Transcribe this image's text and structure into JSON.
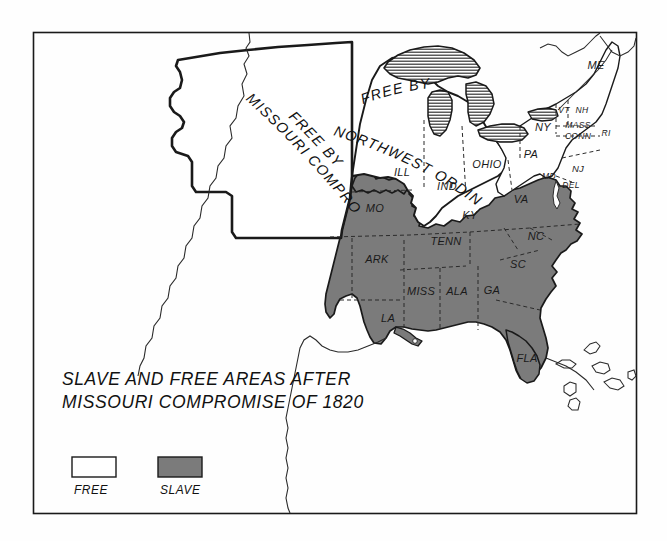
{
  "figure": {
    "kind": "historical-map",
    "title_line1": "SLAVE AND FREE AREAS AFTER",
    "title_line2": "MISSOURI COMPROMISE OF 1820",
    "frame_color": "#1a1a1a",
    "background_color": "#fefefe"
  },
  "colors": {
    "slave_fill": "#7b7b7b",
    "free_fill": "#ffffff",
    "outline": "#1a1a1a",
    "lake_hatch": "#2a2a2a",
    "internal_border": "#2b2b2b"
  },
  "regions": [
    {
      "id": "free-missouri-compromise",
      "label_line1": "FREE BY",
      "label_line2": "MISSOURI COMPROMISE",
      "status": "FREE"
    },
    {
      "id": "free-northwest-ordinance",
      "label_line1": "FREE BY",
      "label_line2": "NORTHWEST ORDINANCE",
      "status": "FREE"
    }
  ],
  "states": {
    "free": [
      {
        "abbr": "ILL",
        "x": 402,
        "y": 176,
        "size": ""
      },
      {
        "abbr": "IND",
        "x": 447,
        "y": 190,
        "size": ""
      },
      {
        "abbr": "OHIO",
        "x": 487,
        "y": 168,
        "size": ""
      },
      {
        "abbr": "PA",
        "x": 531,
        "y": 158,
        "size": ""
      },
      {
        "abbr": "NY",
        "x": 543,
        "y": 131,
        "size": ""
      },
      {
        "abbr": "NJ",
        "x": 578,
        "y": 172,
        "size": "sm"
      },
      {
        "abbr": "DEL",
        "x": 571,
        "y": 188,
        "size": "xs"
      },
      {
        "abbr": "ME",
        "x": 596,
        "y": 69,
        "size": ""
      },
      {
        "abbr": "VT",
        "x": 564,
        "y": 113,
        "size": "xs"
      },
      {
        "abbr": "NH",
        "x": 582,
        "y": 113,
        "size": "xs"
      },
      {
        "abbr": "MASS",
        "x": 578,
        "y": 128,
        "size": "xs"
      },
      {
        "abbr": "CONN",
        "x": 578,
        "y": 139,
        "size": "xs"
      },
      {
        "abbr": "RI",
        "x": 606,
        "y": 136,
        "size": "xs"
      }
    ],
    "slave": [
      {
        "abbr": "MO",
        "x": 375,
        "y": 212,
        "size": ""
      },
      {
        "abbr": "ARK",
        "x": 377,
        "y": 263,
        "size": ""
      },
      {
        "abbr": "LA",
        "x": 388,
        "y": 322,
        "size": ""
      },
      {
        "abbr": "MISS",
        "x": 421,
        "y": 295,
        "size": ""
      },
      {
        "abbr": "ALA",
        "x": 457,
        "y": 295,
        "size": ""
      },
      {
        "abbr": "GA",
        "x": 492,
        "y": 294,
        "size": ""
      },
      {
        "abbr": "TENN",
        "x": 446,
        "y": 245,
        "size": ""
      },
      {
        "abbr": "KY",
        "x": 470,
        "y": 219,
        "size": ""
      },
      {
        "abbr": "VA",
        "x": 521,
        "y": 203,
        "size": ""
      },
      {
        "abbr": "NC",
        "x": 536,
        "y": 240,
        "size": ""
      },
      {
        "abbr": "SC",
        "x": 518,
        "y": 268,
        "size": ""
      },
      {
        "abbr": "FLA",
        "x": 527,
        "y": 362,
        "size": ""
      },
      {
        "abbr": "MD",
        "x": 549,
        "y": 179,
        "size": "xs"
      }
    ]
  },
  "legend": {
    "items": [
      {
        "label": "FREE",
        "swatch": "#ffffff",
        "x": 72,
        "y": 457
      },
      {
        "label": "SLAVE",
        "swatch": "#7b7b7b",
        "x": 158,
        "y": 457
      }
    ]
  }
}
